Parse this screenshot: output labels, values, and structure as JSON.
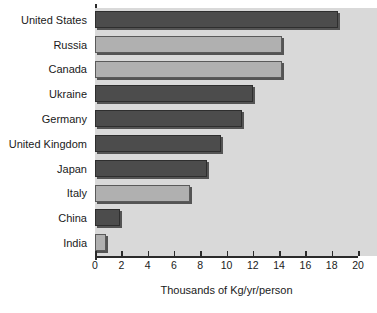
{
  "chart_data": {
    "type": "bar",
    "orientation": "horizontal",
    "title": "",
    "xlabel": "Thousands of Kg/yr/person",
    "ylabel": "",
    "categories": [
      "United States",
      "Russia",
      "Canada",
      "Ukraine",
      "Germany",
      "United Kingdom",
      "Japan",
      "Italy",
      "China",
      "India"
    ],
    "values": [
      18.5,
      14.2,
      14.2,
      12.0,
      11.2,
      9.6,
      8.5,
      7.2,
      1.9,
      0.8
    ],
    "xlim": [
      0,
      20
    ],
    "xticks": [
      0,
      2,
      4,
      6,
      8,
      10,
      12,
      14,
      16,
      18,
      20
    ],
    "xtick_labels": [
      "0",
      "2",
      "4",
      "6",
      "8",
      "10",
      "12",
      "14",
      "16",
      "18",
      "20"
    ],
    "grid": false,
    "legend": "none",
    "bar_styles": [
      "dark",
      "light",
      "light",
      "dark",
      "dark",
      "dark",
      "dark",
      "light",
      "dark",
      "light"
    ],
    "colors": {
      "bar_dark": "#4c4c4c",
      "bar_light": "#b0b0b0",
      "plot_background": "#d9d9d9",
      "axis": "#2b2b2b",
      "text": "#1a1a1a",
      "figure_background": "#ffffff"
    }
  }
}
